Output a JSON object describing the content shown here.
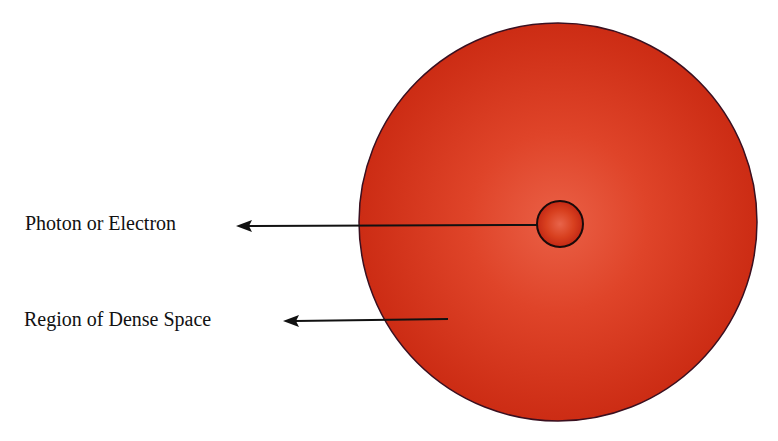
{
  "diagram": {
    "labels": {
      "photon": "Photon or Electron",
      "region": "Region of Dense Space"
    },
    "colors": {
      "region_center": "#e8553a",
      "region_mid": "#d93a20",
      "region_edge": "#c82a14",
      "region_outline": "#3a1020",
      "particle_center": "#e45a3f",
      "particle_edge": "#c8281a",
      "particle_outline": "#1a0a0a",
      "arrow": "#111111",
      "text": "#111111"
    },
    "region_circle": {
      "cx": 558,
      "cy": 222,
      "r": 199
    },
    "particle_circle": {
      "cx": 560,
      "cy": 224,
      "r": 23
    },
    "arrows": [
      {
        "name": "photon-arrow",
        "x1": 537,
        "y1": 225,
        "x2": 236,
        "y2": 226
      },
      {
        "name": "region-arrow",
        "x1": 448,
        "y1": 319,
        "x2": 283,
        "y2": 321
      }
    ]
  }
}
